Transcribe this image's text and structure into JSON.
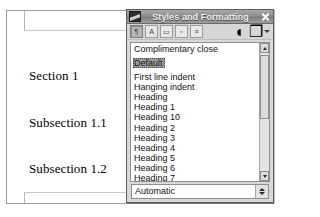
{
  "document": {
    "lines": [
      "Section 1",
      "Subsection 1.1",
      "Subsection 1.2"
    ]
  },
  "styles_panel": {
    "title": "Styles and Formatting",
    "panel_icon": "styles-panel-icon",
    "close_label": "✕",
    "toolbar": {
      "category_buttons": [
        {
          "name": "paragraph-styles-button",
          "glyph": "¶",
          "pressed": true
        },
        {
          "name": "character-styles-button",
          "glyph": "A",
          "pressed": false
        },
        {
          "name": "frame-styles-button",
          "glyph": "▭",
          "pressed": false
        },
        {
          "name": "page-styles-button",
          "glyph": "▫",
          "pressed": false
        },
        {
          "name": "list-styles-button",
          "glyph": "≡",
          "pressed": false
        }
      ],
      "fill_format_button": {
        "name": "fill-format-mode-button",
        "glyph": "◐"
      },
      "new_style_button": {
        "name": "new-style-from-selection-button",
        "glyph": "❐"
      },
      "new_style_dropdown": {
        "name": "new-style-dropdown-arrow"
      }
    },
    "list": {
      "items": [
        {
          "label": "Complimentary close",
          "selected": false
        },
        {
          "label": "Default",
          "selected": true
        },
        {
          "label": "First line indent",
          "selected": false
        },
        {
          "label": "Hanging indent",
          "selected": false
        },
        {
          "label": "Heading",
          "selected": false
        },
        {
          "label": "Heading 1",
          "selected": false
        },
        {
          "label": "Heading 10",
          "selected": false
        },
        {
          "label": "Heading 2",
          "selected": false
        },
        {
          "label": "Heading 3",
          "selected": false
        },
        {
          "label": "Heading 4",
          "selected": false
        },
        {
          "label": "Heading 5",
          "selected": false
        },
        {
          "label": "Heading 6",
          "selected": false
        },
        {
          "label": "Heading 7",
          "selected": false
        },
        {
          "label": "Heading 8",
          "selected": false
        }
      ]
    },
    "filter_combo": {
      "value": "Automatic"
    }
  },
  "colors": {
    "titlebar": "#8e8e8e",
    "panel_face": "#d8d8d8",
    "selection": "#9a9a9a",
    "list_background": "#ffffff",
    "text": "#111111"
  }
}
